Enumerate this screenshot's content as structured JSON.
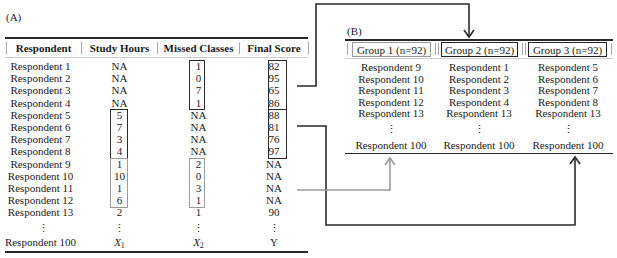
{
  "panel_a": {
    "label": "(A)",
    "headers": [
      "Respondent",
      "Study Hours",
      "Missed Classes",
      "Final Score"
    ],
    "rows": [
      [
        "Respondent 1",
        "NA",
        "1",
        "82"
      ],
      [
        "Respondent 2",
        "NA",
        "0",
        "95"
      ],
      [
        "Respondent 3",
        "NA",
        "7",
        "65"
      ],
      [
        "Respondent 4",
        "NA",
        "1",
        "86"
      ],
      [
        "Respondent 5",
        "5",
        "NA",
        "88"
      ],
      [
        "Respondent 6",
        "7",
        "NA",
        "81"
      ],
      [
        "Respondent 7",
        "3",
        "NA",
        "76"
      ],
      [
        "Respondent 8",
        "4",
        "NA",
        "97"
      ],
      [
        "Respondent 9",
        "1",
        "2",
        "NA"
      ],
      [
        "Respondent 10",
        "10",
        "0",
        "NA"
      ],
      [
        "Respondent 11",
        "1",
        "3",
        "NA"
      ],
      [
        "Respondent 12",
        "6",
        "1",
        "NA"
      ],
      [
        "Respondent 13",
        "2",
        "1",
        "90"
      ]
    ],
    "ellipsis": "⋮",
    "last_row": {
      "respondent": "Respondent 100",
      "x1": "X",
      "x1_sub": "1",
      "x2": "X",
      "x2_sub": "2",
      "y": "Y"
    }
  },
  "panel_b": {
    "label": "(B)",
    "groups": [
      {
        "title": "Group 1 (n=92)",
        "style": "light",
        "members": [
          "Respondent 9",
          "Respondent 10",
          "Respondent 11",
          "Respondent 12",
          "Respondent 13"
        ],
        "last": "Respondent 100"
      },
      {
        "title": "Group 2 (n=92)",
        "style": "dark",
        "members": [
          "Respondent 1",
          "Respondent 2",
          "Respondent 3",
          "Respondent 4",
          "Respondent 13"
        ],
        "last": "Respondent 100"
      },
      {
        "title": "Group 3 (n=92)",
        "style": "dark",
        "members": [
          "Respondent 5",
          "Respondent 6",
          "Respondent 7",
          "Respondent 8",
          "Respondent 13"
        ],
        "last": "Respondent 100"
      }
    ],
    "ellipsis": "⋮"
  },
  "colors": {
    "dark_line": "#2a2a2a",
    "light_line": "#9a9a9a"
  }
}
